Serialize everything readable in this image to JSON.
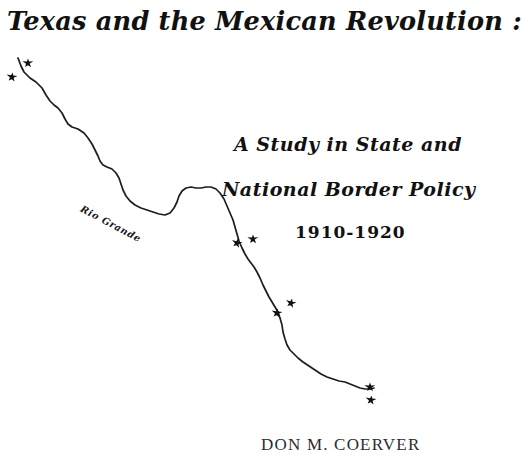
{
  "document": {
    "type": "title-page",
    "background_color": "#ffffff",
    "ink_color": "#111111"
  },
  "title": {
    "main": "Texas and the Mexican Revolution :",
    "subtitle_line_1": "A Study in State and",
    "subtitle_line_2": "National Border Policy",
    "date_range": "1910-1920"
  },
  "author": {
    "name": "DON M. COERVER"
  },
  "map": {
    "label": "Rio Grande",
    "river_label_name": "rio-grande-label",
    "stroke_color": "#1d1d1d",
    "star_color": "#111111",
    "river_path": "M18,58 L21,66 L24,72 L30,78 L36,82 L42,88 L46,95 L50,101 L54,105 L58,108 L62,113 L65,119 L68,124 L72,127 L78,129 L84,133 L88,138 L92,144 L95,150 L98,156 L100,161 L103,165 L107,167 L112,169 L116,173 L119,178 L121,184 L123,190 L126,196 L130,201 L135,205 L141,208 L147,210 L153,212 L159,214 L165,215 L170,213 L174,208 L177,202 L179,196 L182,191 L186,188 L191,187 L196,188 L201,188 L206,187 L211,187 L216,189 L220,193 L224,199 L227,206 L230,213 L233,220 L235,227 L237,234 L239,241 L242,248 L245,254 L248,259 L251,263 L254,267 L257,272 L260,278 L263,285 L266,291 L269,297 L272,302 L275,307 L278,312 L280,318 L282,325 L283,332 L285,339 L287,345 L290,350 L294,354 L298,358 L303,362 L309,366 L315,370 L321,374 L327,377 L333,379 L339,381 L345,382 L350,384 L355,386 L360,388 L365,389 L370,389 L374,388",
    "stars": [
      {
        "name": "star-marker-1",
        "x": 28,
        "y": 63
      },
      {
        "name": "star-marker-2",
        "x": 12,
        "y": 77
      },
      {
        "name": "star-marker-3",
        "x": 237,
        "y": 243
      },
      {
        "name": "star-marker-4",
        "x": 253,
        "y": 239
      },
      {
        "name": "star-marker-5",
        "x": 277,
        "y": 313
      },
      {
        "name": "star-marker-6",
        "x": 291,
        "y": 303
      },
      {
        "name": "star-marker-7",
        "x": 370,
        "y": 387
      },
      {
        "name": "star-marker-8",
        "x": 371,
        "y": 400
      }
    ]
  }
}
